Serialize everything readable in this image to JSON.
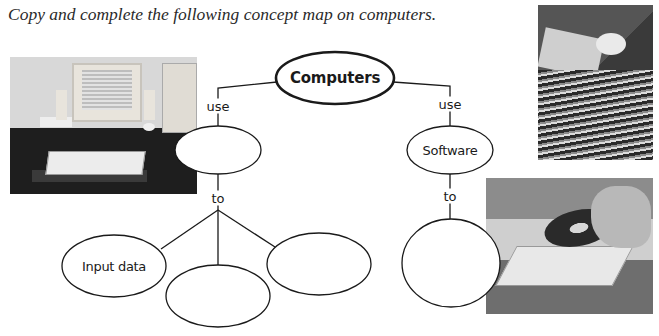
{
  "instruction": "Copy and complete the following concept map on computers.",
  "concept_map": {
    "root": {
      "label": "Computers"
    },
    "branches": [
      {
        "link_label": "use",
        "node": {
          "label": ""
        },
        "sub_link_label": "to",
        "children": [
          {
            "label": "Input data"
          },
          {
            "label": ""
          },
          {
            "label": ""
          }
        ]
      },
      {
        "link_label": "use",
        "node": {
          "label": "Software"
        },
        "sub_link_label": "to",
        "children": [
          {
            "label": ""
          }
        ]
      }
    ]
  },
  "images": [
    {
      "name": "desktop-computer-photo",
      "alt": "Desktop computer with monitor, tower, keyboard and speakers"
    },
    {
      "name": "floppy-disks-photo",
      "alt": "Stack of floppy disks"
    },
    {
      "name": "cd-drive-photo",
      "alt": "Hand inserting a CD into a drive tray"
    }
  ],
  "colors": {
    "line": "#1a1a1a",
    "node_fill": "#ffffff",
    "text": "#1a1a1a"
  }
}
